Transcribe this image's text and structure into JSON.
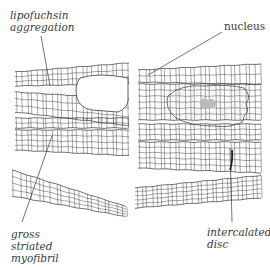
{
  "figure": {
    "labels": [
      {
        "id": "lipofuchsin",
        "lines": [
          "lipofuchsin",
          "aggregation"
        ],
        "x": 10,
        "y": 9,
        "italic": true
      },
      {
        "id": "nucleus",
        "lines": [
          "nucleus"
        ],
        "x": 224,
        "y": 20,
        "italic": false
      },
      {
        "id": "gross-striated-myofibril",
        "lines": [
          "gross",
          "striated",
          "myofibril"
        ],
        "x": 11,
        "y": 228,
        "italic": true
      },
      {
        "id": "intercalated-disc",
        "lines": [
          "intercalated",
          "disc"
        ],
        "x": 207,
        "y": 226,
        "italic": true
      }
    ],
    "leaders": [
      {
        "id": "lipofuchsin-leader",
        "x1": 41,
        "y1": 36,
        "x2": 50,
        "y2": 86
      },
      {
        "id": "nucleus-leader",
        "x1": 222,
        "y1": 32,
        "x2": 148,
        "y2": 75
      },
      {
        "id": "myofibril-leader",
        "x1": 22,
        "y1": 222,
        "x2": 52,
        "y2": 136
      },
      {
        "id": "disc-leader",
        "x1": 232,
        "y1": 222,
        "x2": 230,
        "y2": 148
      }
    ],
    "colors": {
      "ink": "#3a3a3a",
      "stipple": "#9a9a9a",
      "background": "#ffffff"
    }
  }
}
